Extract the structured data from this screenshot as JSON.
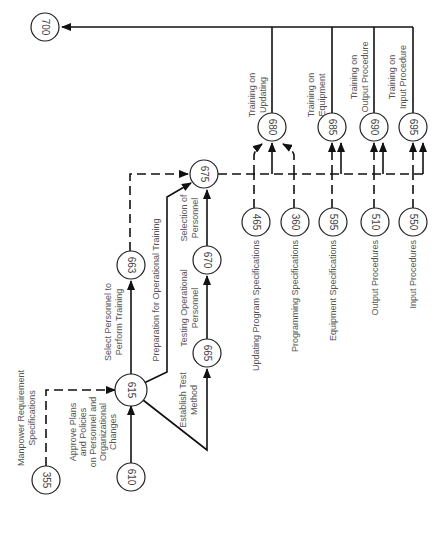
{
  "diagram": {
    "type": "activity network (rotated 90°)",
    "nodes": {
      "n700": "700",
      "n680": "680",
      "n685": "685",
      "n690": "690",
      "n695": "695",
      "n675": "675",
      "n663": "663",
      "n670": "670",
      "n465": "465",
      "n360": "360",
      "n595": "595",
      "n510": "510",
      "n550": "550",
      "n615": "615",
      "n665": "665",
      "n355": "355",
      "n610": "610"
    },
    "edges": {
      "e680_700": [
        "Training on",
        "Updating"
      ],
      "e685_700": [
        "Training on",
        "Equipment"
      ],
      "e690_700": [
        "Training on",
        "Output Procedure"
      ],
      "e695_700": [
        "Training on",
        "Input Procedure"
      ],
      "e615_663": [
        "Select Personnel to",
        "Perform Training"
      ],
      "e615_675": [
        "Preparation for Operational Training"
      ],
      "e665_670": [
        "Testing Operational",
        "Personnel"
      ],
      "e670_675": [
        "Selection of",
        "Personnel"
      ],
      "e615_665": [
        "Establish Test",
        "Method"
      ],
      "e610_615": [
        "Approve Plans",
        "and Policies",
        "on Personnel and",
        "Organizational",
        "Changes"
      ],
      "e355_615": [
        "Manpower Requirement",
        "Specifications"
      ],
      "e465": [
        "Updating Program Specifications"
      ],
      "e360": [
        "Programming Specifications"
      ],
      "e595": [
        "Equipment Specifications"
      ],
      "e510": [
        "Output Procedures"
      ],
      "e550": [
        "Input Procedures"
      ]
    }
  }
}
